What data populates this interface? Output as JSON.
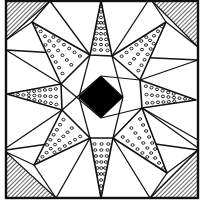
{
  "diagram": {
    "colors": {
      "ink": "#111111",
      "paper": "#ffffff",
      "center": "#000000"
    },
    "star_points": [
      {
        "id": "n",
        "pattern": "dots"
      },
      {
        "id": "ne",
        "pattern": "dots"
      },
      {
        "id": "e",
        "pattern": "dots"
      },
      {
        "id": "se",
        "pattern": "dots"
      },
      {
        "id": "s",
        "pattern": "dots"
      },
      {
        "id": "sw",
        "pattern": "dots"
      },
      {
        "id": "w",
        "pattern": "dots"
      },
      {
        "id": "nw",
        "pattern": "dots"
      }
    ],
    "corners": [
      {
        "id": "top-left",
        "pattern": "hatched"
      },
      {
        "id": "top-right",
        "pattern": "hatched"
      },
      {
        "id": "bottom-left",
        "pattern": "hatched"
      },
      {
        "id": "bottom-right",
        "pattern": "hatched"
      }
    ],
    "center_piece": {
      "shape": "diamond",
      "fill": "solid-black"
    }
  }
}
